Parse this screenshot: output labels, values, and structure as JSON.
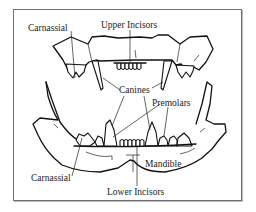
{
  "figure": {
    "labels": {
      "carnassial_upper": "Carnassial",
      "upper_incisors": "Upper Incisors",
      "canines": "Canines",
      "premolars": "Premolars",
      "mandible": "Mandible",
      "carnassial_lower": "Carnassial",
      "lower_incisors": "Lower Incisors"
    },
    "colors": {
      "line": "#111111",
      "frame": "#6e6e6e",
      "background": "#ffffff"
    }
  }
}
